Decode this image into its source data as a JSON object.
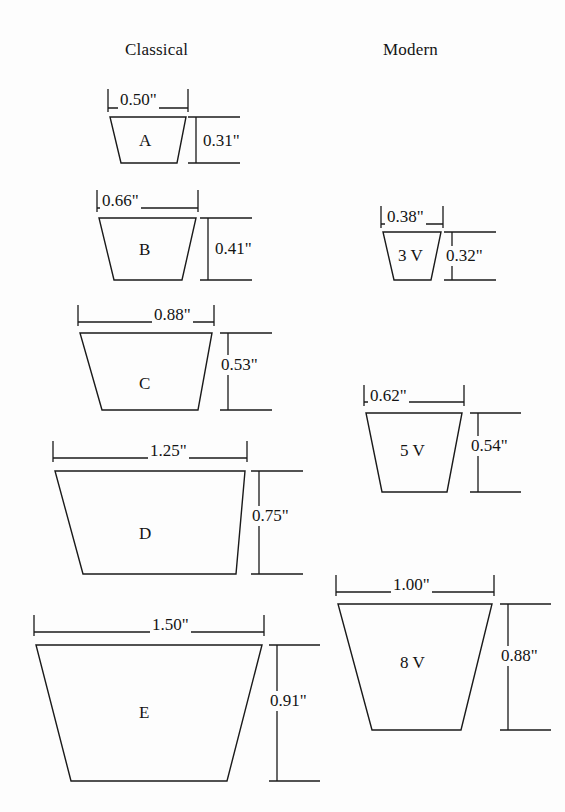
{
  "figure": {
    "background_color": "#fdfdfd",
    "line_color": "#1a1a1a",
    "unit_symbol": "\""
  },
  "columns": [
    {
      "id": "classical",
      "title": "Classical"
    },
    {
      "id": "modern",
      "title": "Modern"
    }
  ],
  "belts": [
    {
      "id": "a",
      "column": "classical",
      "label": "A",
      "top_width": "0.50\"",
      "height": "0.31\"",
      "geometry": {
        "top_left": 110,
        "top_right": 186,
        "bottom_left": 121,
        "bottom_right": 177,
        "top_y": 117,
        "bottom_y": 163
      },
      "width_dim": {
        "left": 108,
        "right": 188,
        "line_y": 108,
        "tick_top": 89,
        "label_x": 118,
        "label_y": 90
      },
      "height_dim": {
        "x": 196,
        "top_y": 117,
        "bottom_y": 163,
        "ext_right": 240,
        "label_x": 201,
        "label_y": 131
      }
    },
    {
      "id": "b",
      "column": "classical",
      "label": "B",
      "top_width": "0.66\"",
      "height": "0.41\"",
      "geometry": {
        "top_left": 99,
        "top_right": 196,
        "bottom_left": 114,
        "bottom_right": 182,
        "top_y": 218,
        "bottom_y": 280
      },
      "width_dim": {
        "left": 97,
        "right": 198,
        "line_y": 208,
        "tick_top": 190,
        "label_x": 100,
        "label_y": 191
      },
      "height_dim": {
        "x": 208,
        "top_y": 218,
        "bottom_y": 280,
        "ext_right": 252,
        "label_x": 213,
        "label_y": 239
      }
    },
    {
      "id": "c",
      "column": "classical",
      "label": "C",
      "top_width": "0.88\"",
      "height": "0.53\"",
      "geometry": {
        "top_left": 80,
        "top_right": 212,
        "bottom_left": 102,
        "bottom_right": 198,
        "top_y": 333,
        "bottom_y": 410
      },
      "width_dim": {
        "left": 78,
        "right": 214,
        "line_y": 322,
        "tick_top": 305,
        "label_x": 152,
        "label_y": 305
      },
      "height_dim": {
        "x": 228,
        "top_y": 333,
        "bottom_y": 410,
        "ext_right": 272,
        "label_x": 219,
        "label_y": 355
      }
    },
    {
      "id": "d",
      "column": "classical",
      "label": "D",
      "top_width": "1.25\"",
      "height": "0.75\"",
      "geometry": {
        "top_left": 55,
        "top_right": 245,
        "bottom_left": 83,
        "bottom_right": 236,
        "top_y": 471,
        "bottom_y": 574
      },
      "width_dim": {
        "left": 53,
        "right": 247,
        "line_y": 458,
        "tick_top": 441,
        "label_x": 148,
        "label_y": 441
      },
      "height_dim": {
        "x": 259,
        "top_y": 471,
        "bottom_y": 574,
        "ext_right": 303,
        "label_x": 250,
        "label_y": 506
      }
    },
    {
      "id": "e",
      "column": "classical",
      "label": "E",
      "top_width": "1.50\"",
      "height": "0.91\"",
      "geometry": {
        "top_left": 36,
        "top_right": 262,
        "bottom_left": 71,
        "bottom_right": 227,
        "top_y": 645,
        "bottom_y": 781
      },
      "width_dim": {
        "left": 34,
        "right": 264,
        "line_y": 632,
        "tick_top": 615,
        "label_x": 150,
        "label_y": 615
      },
      "height_dim": {
        "x": 277,
        "top_y": 645,
        "bottom_y": 781,
        "ext_right": 320,
        "label_x": 268,
        "label_y": 691
      }
    },
    {
      "id": "3v",
      "column": "modern",
      "label": "3 V",
      "top_width": "0.38\"",
      "height": "0.32\"",
      "geometry": {
        "top_left": 383,
        "top_right": 441,
        "bottom_left": 394,
        "bottom_right": 431,
        "top_y": 232,
        "bottom_y": 280
      },
      "width_dim": {
        "left": 381,
        "right": 443,
        "line_y": 224,
        "tick_top": 206,
        "label_x": 385,
        "label_y": 207
      },
      "height_dim": {
        "x": 452,
        "top_y": 232,
        "bottom_y": 280,
        "ext_right": 496,
        "label_x": 444,
        "label_y": 246
      }
    },
    {
      "id": "5v",
      "column": "modern",
      "label": "5 V",
      "top_width": "0.62\"",
      "height": "0.54\"",
      "geometry": {
        "top_left": 366,
        "top_right": 462,
        "bottom_left": 382,
        "bottom_right": 447,
        "top_y": 413,
        "bottom_y": 492
      },
      "width_dim": {
        "left": 364,
        "right": 464,
        "line_y": 402,
        "tick_top": 385,
        "label_x": 368,
        "label_y": 386
      },
      "height_dim": {
        "x": 478,
        "top_y": 413,
        "bottom_y": 492,
        "ext_right": 521,
        "label_x": 469,
        "label_y": 436
      }
    },
    {
      "id": "8v",
      "column": "modern",
      "label": "8 V",
      "top_width": "1.00\"",
      "height": "0.88\"",
      "geometry": {
        "top_left": 338,
        "top_right": 492,
        "bottom_left": 372,
        "bottom_right": 461,
        "top_y": 604,
        "bottom_y": 730
      },
      "width_dim": {
        "left": 336,
        "right": 494,
        "line_y": 592,
        "tick_top": 575,
        "label_x": 391,
        "label_y": 575
      },
      "height_dim": {
        "x": 508,
        "top_y": 604,
        "bottom_y": 730,
        "ext_right": 551,
        "label_x": 499,
        "label_y": 646
      }
    }
  ],
  "headings": {
    "classical": {
      "text": "Classical",
      "x": 125,
      "y": 40
    },
    "modern": {
      "text": "Modern",
      "x": 383,
      "y": 40
    }
  },
  "belt_center_labels": {
    "a": {
      "x": 139,
      "y": 131
    },
    "b": {
      "x": 139,
      "y": 240
    },
    "c": {
      "x": 139,
      "y": 374
    },
    "d": {
      "x": 139,
      "y": 524
    },
    "e": {
      "x": 139,
      "y": 703
    },
    "3v": {
      "x": 398,
      "y": 246
    },
    "5v": {
      "x": 400,
      "y": 441
    },
    "8v": {
      "x": 400,
      "y": 653
    }
  }
}
